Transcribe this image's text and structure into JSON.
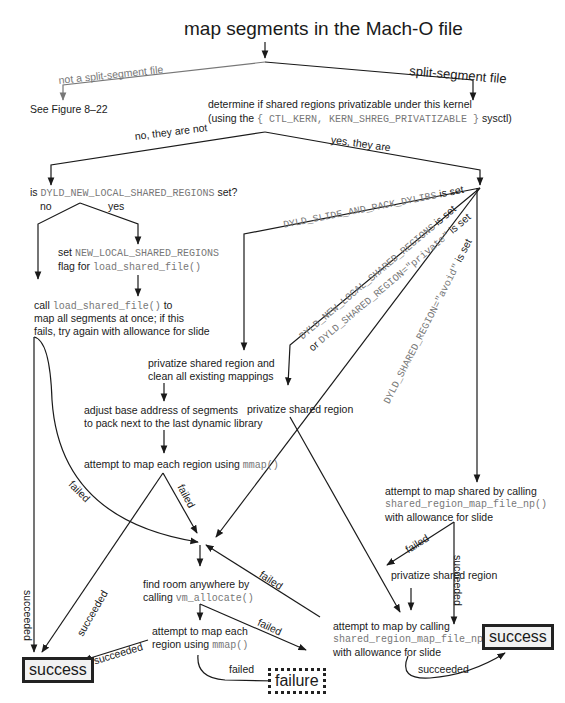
{
  "title": "map segments in the Mach-O file",
  "branches": {
    "not_split": "not a split-segment file",
    "split": "split-segment file",
    "see_figure": "See Figure 8–22"
  },
  "determine": {
    "line1": "determine if shared regions privatizable under this kernel",
    "line2_prefix": "(using the ",
    "line2_code": "{ CTL_KERN, KERN_SHREG_PRIVATIZABLE }",
    "line2_suffix": " sysctl)"
  },
  "priv_branches": {
    "no": "no, they are not",
    "yes": "yes, they are"
  },
  "is_set": {
    "prefix": "is ",
    "code": "DYLD_NEW_LOCAL_SHARED_REGIONS",
    "suffix": " set?",
    "no": "no",
    "yes": "yes"
  },
  "set_flag": {
    "prefix": "set ",
    "code1": "NEW_LOCAL_SHARED_REGIONS",
    "line2_prefix": "flag for ",
    "code2": "load_shared_file()"
  },
  "call_load": {
    "prefix": "call ",
    "code": "load_shared_file()",
    "suffix": " to",
    "line2": "map all segments at once; if this",
    "line3": "fails, try again with allowance for slide"
  },
  "env_labels": {
    "slide_pack": {
      "code": "DYLD_SLIDE_AND_PACK_DYLIBS",
      "suffix": " is set"
    },
    "new_local": {
      "code": "DYLD_NEW_LOCAL_SHARED_REGIONS",
      "suffix": " is set"
    },
    "private": {
      "prefix": "or ",
      "code": "DYLD_SHARED_REGION=\"private\"",
      "suffix": " is set"
    },
    "avoid": {
      "code": "DYLD_SHARED_REGION=\"avoid\"",
      "suffix": " is set"
    }
  },
  "privatize_clean": {
    "line1": "privatize shared region and",
    "line2": "clean all existing mappings"
  },
  "privatize_mid": "privatize shared region",
  "adjust": {
    "line1": "adjust base address of segments",
    "line2": "to pack next to the last dynamic library"
  },
  "attempt_mmap": {
    "prefix": "attempt to map each region using ",
    "code": "mmap()"
  },
  "attempt_shared": {
    "line1": "attempt to map shared by calling",
    "code": "shared_region_map_file_np()",
    "line3": "with allowance for slide"
  },
  "privatize_right": "privatize shared region",
  "find_room": {
    "line1": "find room anywhere by",
    "prefix": "calling ",
    "code": "vm_allocate()"
  },
  "attempt_each": {
    "line1": "attempt to map each",
    "prefix": "region using ",
    "code": "mmap()"
  },
  "attempt_by": {
    "line1": "attempt to map by calling",
    "code": "shared_region_map_file_np()",
    "line3": "with allowance for slide"
  },
  "edge_labels": {
    "failed": "failed",
    "succeeded": "succeeded"
  },
  "terminals": {
    "success": "success",
    "failure": "failure"
  }
}
